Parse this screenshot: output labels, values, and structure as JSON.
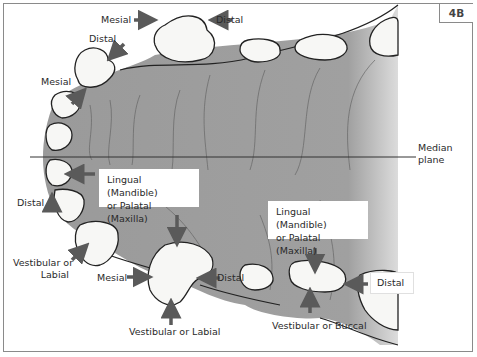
{
  "figure": {
    "panel_label": "4B",
    "median_plane_label": [
      "Median",
      "plane"
    ],
    "colors": {
      "palate": "#9a9a9a",
      "palate_light": "#d8d8d8",
      "tooth_fill": "#f7f7f5",
      "arrow": "#5a5a5a",
      "outline": "#222222",
      "frame": "#8a8a8a"
    }
  },
  "labels": {
    "top_mesial": "Mesial",
    "top_distal": "Distal",
    "canine_distal": "Distal",
    "incisor_mesial": "Mesial",
    "left_distal": "Distal",
    "vestibular_labial_left": [
      "Vestibular or",
      "Labial"
    ],
    "canine_mesial": "Mesial",
    "canine_distal_bottom": "Distal",
    "vestibular_labial_bottom": "Vestibular or Labial",
    "lingual_box_left": [
      "Lingual (Mandible)",
      "or Palatal (Maxilla)"
    ],
    "lingual_box_right": [
      "Lingual (Mandible)",
      "or Palatal (Maxilla)"
    ],
    "premolar_distal": "Distal",
    "vestibular_buccal": "Vestibular or Buccal"
  }
}
